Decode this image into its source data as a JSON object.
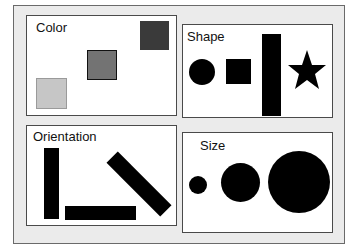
{
  "panels": {
    "color": {
      "title": "Color",
      "swatches": [
        "#c8c8c8",
        "#737373",
        "#3a3a3a"
      ]
    },
    "shape": {
      "title": "Shape",
      "items": [
        "circle",
        "square",
        "tall-rectangle",
        "star"
      ]
    },
    "orientation": {
      "title": "Orientation",
      "items": [
        "vertical-bar",
        "horizontal-bar",
        "diagonal-bar"
      ]
    },
    "size": {
      "title": "Size",
      "items": [
        "small-circle",
        "medium-circle",
        "large-circle"
      ]
    }
  }
}
